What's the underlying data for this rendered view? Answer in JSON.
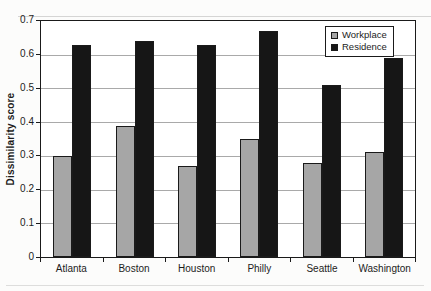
{
  "chart_data": {
    "type": "bar",
    "title": "",
    "xlabel": "",
    "ylabel": "Dissimilarity score",
    "categories": [
      "Atlanta",
      "Boston",
      "Houston",
      "Philly",
      "Seattle",
      "Washington"
    ],
    "series": [
      {
        "name": "Workplace",
        "color": "#a6a6a6",
        "values": [
          0.3,
          0.39,
          0.27,
          0.35,
          0.28,
          0.31
        ]
      },
      {
        "name": "Residence",
        "color": "#161616",
        "values": [
          0.63,
          0.64,
          0.63,
          0.67,
          0.51,
          0.59
        ]
      }
    ],
    "ylim": [
      0,
      0.7
    ],
    "yticks": [
      0,
      0.1,
      0.2,
      0.3,
      0.4,
      0.5,
      0.6,
      0.7
    ],
    "ytick_labels": [
      "0",
      "0.1",
      "0.2",
      "0.3",
      "0.4",
      "0.5",
      "0.6",
      "0.7"
    ],
    "grid": true,
    "gridline_color": "#a9a9a9",
    "bar_border_color": "#1a1a1a",
    "frame_color": "#1a1a1a",
    "plot_background": "#ffffff",
    "legend_position": "top-right"
  }
}
